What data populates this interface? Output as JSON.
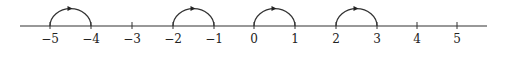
{
  "diagram": {
    "type": "number-line",
    "axis": {
      "x_start": 20,
      "x_end": 487,
      "y": 26,
      "color": "#333333"
    },
    "ticks": [
      {
        "value": -5,
        "label": "−5",
        "x": 50
      },
      {
        "value": -4,
        "label": "−4",
        "x": 91
      },
      {
        "value": -3,
        "label": "−3",
        "x": 132
      },
      {
        "value": -2,
        "label": "−2",
        "x": 173
      },
      {
        "value": -1,
        "label": "−1",
        "x": 214
      },
      {
        "value": 0,
        "label": "0",
        "x": 254
      },
      {
        "value": 1,
        "label": "1",
        "x": 295
      },
      {
        "value": 2,
        "label": "2",
        "x": 336
      },
      {
        "value": 3,
        "label": "3",
        "x": 377
      },
      {
        "value": 4,
        "label": "4",
        "x": 417
      },
      {
        "value": 5,
        "label": "5",
        "x": 457
      }
    ],
    "arcs": [
      {
        "from": -5,
        "to": -4,
        "direction": "right"
      },
      {
        "from": -2,
        "to": -1,
        "direction": "right"
      },
      {
        "from": 0,
        "to": 1,
        "direction": "right"
      },
      {
        "from": 2,
        "to": 3,
        "direction": "right"
      }
    ]
  }
}
